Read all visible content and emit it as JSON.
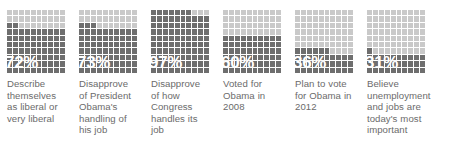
{
  "chart_data": {
    "type": "bar",
    "title": "",
    "subtitle": "",
    "xlabel": "",
    "ylabel": "",
    "grid": true,
    "legend": "none",
    "ylim": [
      0,
      100
    ],
    "units": "percent",
    "representation": "waffle-grid-10x10-filled-from-bottom",
    "categories": [
      "Describe themselves as liberal or very liberal",
      "Disapprove of President Obama's handling of his job",
      "Disapprove of how Congress handles its job",
      "Voted for Obama in 2008",
      "Plan to vote for Obama in 2012",
      "Believe unemployment and jobs are today's most important"
    ],
    "values": [
      72,
      73,
      97,
      60,
      36,
      31
    ],
    "colors": {
      "filled": "#6e6e6e",
      "empty": "#c9c9c9",
      "gridline": "#ffffff",
      "value_label": "#ffffff",
      "caption": "#6b6b6b",
      "background": "#ffffff"
    }
  },
  "stats": [
    {
      "value": 72,
      "value_label": "72%",
      "caption": "Describe themselves as liberal or very liberal"
    },
    {
      "value": 73,
      "value_label": "73%",
      "caption": "Disapprove of President Obama's handling of his job"
    },
    {
      "value": 97,
      "value_label": "97%",
      "caption": "Disapprove of how Congress handles its job"
    },
    {
      "value": 60,
      "value_label": "60%",
      "caption": "Voted for Obama in 2008"
    },
    {
      "value": 36,
      "value_label": "36%",
      "caption": "Plan to vote for Obama in 2012"
    },
    {
      "value": 31,
      "value_label": "31%",
      "caption": "Believe unemployment and jobs are today's most important"
    }
  ]
}
